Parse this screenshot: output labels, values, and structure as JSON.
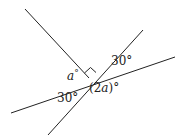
{
  "diagram": {
    "type": "intersecting-lines-angles",
    "lines": [
      {
        "name": "line-upper-left",
        "x1": 25,
        "y1": 9,
        "x2": 89,
        "y2": 78
      },
      {
        "name": "line-steep",
        "x1": 143,
        "y1": 30,
        "x2": 48,
        "y2": 135
      },
      {
        "name": "line-shallow",
        "x1": 175,
        "y1": 57,
        "x2": 11,
        "y2": 113
      }
    ],
    "right_angle_marker": true,
    "labels": {
      "a": "a",
      "deg": "°",
      "angle_upper_right": "30°",
      "angle_lower_left": "30°",
      "angle_2a_open": "(2",
      "angle_2a_var": "a",
      "angle_2a_close": ")°"
    },
    "colors": {
      "line": "#222222",
      "background": "#ffffff"
    }
  }
}
